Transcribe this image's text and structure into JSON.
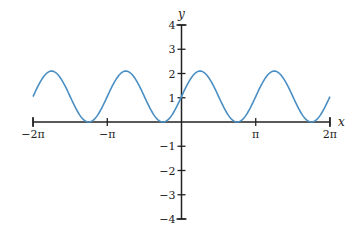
{
  "chart_data": {
    "type": "line",
    "title": "",
    "xlabel": "x",
    "ylabel": "y",
    "function": "y = 1.05 + 1.05*sin(2x)",
    "xlim": [
      -6.2832,
      6.2832
    ],
    "ylim": [
      -4,
      4
    ],
    "grid": false,
    "legend": null,
    "x_ticks": [
      {
        "value": -6.2832,
        "label": "−2π"
      },
      {
        "value": -3.1416,
        "label": "−π"
      },
      {
        "value": 3.1416,
        "label": "π"
      },
      {
        "value": 6.2832,
        "label": "2π"
      }
    ],
    "y_ticks": [
      {
        "value": 4,
        "label": "4"
      },
      {
        "value": 3,
        "label": "3"
      },
      {
        "value": 2,
        "label": "2"
      },
      {
        "value": 1,
        "label": "1"
      },
      {
        "value": -1,
        "label": "−1"
      },
      {
        "value": -2,
        "label": "−2"
      },
      {
        "value": -3,
        "label": "−3"
      },
      {
        "value": -4,
        "label": "−4"
      }
    ],
    "series": [
      {
        "name": "curve",
        "color": "#4a8fc4",
        "amplitude": 1.05,
        "offset": 1.05,
        "period": 3.1416,
        "phase": 0,
        "x_range": [
          -6.2832,
          6.2832
        ],
        "key_points": [
          {
            "x": -6.2832,
            "y": 1.05
          },
          {
            "x": -5.4978,
            "y": 2.1
          },
          {
            "x": -3.927,
            "y": 0
          },
          {
            "x": -2.3562,
            "y": 2.1
          },
          {
            "x": -0.7854,
            "y": 0
          },
          {
            "x": 0,
            "y": 1.05
          },
          {
            "x": 0.7854,
            "y": 2.1
          },
          {
            "x": 2.3562,
            "y": 0
          },
          {
            "x": 3.927,
            "y": 2.1
          },
          {
            "x": 5.4978,
            "y": 0
          },
          {
            "x": 6.2832,
            "y": 1.05
          }
        ]
      }
    ]
  },
  "layout": {
    "origin_px": [
      181.5,
      122
    ],
    "px_per_x_unit": 23.63,
    "px_per_y_unit": 24.25,
    "axis_color": "#222222"
  }
}
